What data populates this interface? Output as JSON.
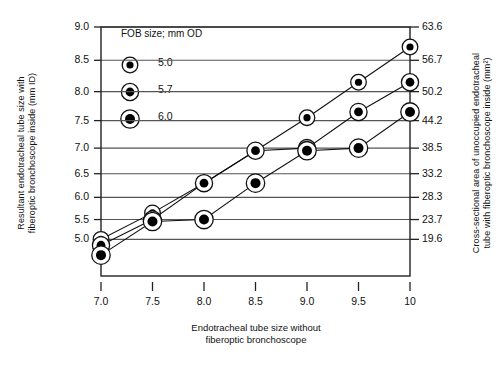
{
  "chart_data": {
    "type": "line",
    "title": "",
    "subtitle": "",
    "xlabel": "Endotracheal tube size without\nfiberoptic bronchoscope",
    "ylabel": "Resultant endotracheal tube size  with\nfiberoptic bronchoscope inside (mm ID)",
    "ylabel_right": "Cross-sectional area of unoccupied endotracheal\ntube with fiberoptic bronchoscope inside (mm²)",
    "x": [
      7.0,
      7.5,
      8.0,
      8.5,
      9.0,
      9.5,
      10.0
    ],
    "xtick_labels": [
      "7.0",
      "7.5",
      "8.0",
      "8.5",
      "9.0",
      "9.5",
      "10"
    ],
    "ytick_labels_left": [
      "9.0",
      "8.5",
      "8.0",
      "7.5",
      "7.0",
      "6.5",
      "6.0",
      "5.5",
      "5.0"
    ],
    "ytick_values_left": [
      9.0,
      8.5,
      8.0,
      7.5,
      7.0,
      6.5,
      6.0,
      5.5,
      5.0
    ],
    "ytick_labels_right": [
      "63.6",
      "56.7",
      "50.2",
      "44.2",
      "38.5",
      "33.2",
      "28.3",
      "23.7",
      "19.6"
    ],
    "ytick_values_right": [
      63.6,
      56.7,
      50.2,
      44.2,
      38.5,
      33.2,
      28.3,
      23.7,
      19.6
    ],
    "ylim": [
      4.55,
      9.0
    ],
    "grid": "horizontal",
    "legend_position": "top-left",
    "legend_title": "FOB size; mm OD",
    "series": [
      {
        "name": "5.0",
        "marker": "ringed-dot",
        "dot_radius_px": 3.6,
        "values": [
          5.0,
          5.65,
          6.3,
          6.95,
          7.55,
          8.15,
          8.7
        ]
      },
      {
        "name": "5.7",
        "marker": "ringed-dot",
        "dot_radius_px": 4.4,
        "values": [
          4.85,
          5.5,
          6.3,
          6.95,
          7.0,
          7.65,
          8.15
        ]
      },
      {
        "name": "6.0",
        "marker": "ringed-dot",
        "dot_radius_px": 5.0,
        "values": [
          4.6,
          5.45,
          5.5,
          6.3,
          6.95,
          7.0,
          7.65
        ]
      }
    ]
  },
  "legend": {
    "title": "FOB size; mm OD",
    "items": [
      {
        "label": "5.0"
      },
      {
        "label": "5.7"
      },
      {
        "label": "6.0"
      }
    ]
  },
  "colors": {
    "ink": "#111111",
    "grid": "#555555",
    "frame": "#222222",
    "marker_fill": "#000000",
    "marker_ring": "#ffffff",
    "background": "#ffffff"
  }
}
